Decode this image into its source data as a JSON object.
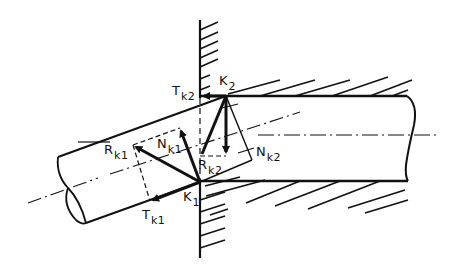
{
  "diagram": {
    "title": "",
    "stroke_color": "#111111",
    "background": "#ffffff",
    "points": {
      "K1": {
        "label": "K",
        "sub": "1"
      },
      "K2": {
        "label": "K",
        "sub": "2"
      }
    },
    "forces": {
      "R_k1": {
        "label": "R",
        "sub": "k1"
      },
      "N_k1": {
        "label": "N",
        "sub": "k1"
      },
      "T_k1": {
        "label": "T",
        "sub": "k1"
      },
      "R_k2": {
        "label": "R",
        "sub": "k2"
      },
      "N_k2": {
        "label": "N",
        "sub": "k2"
      },
      "T_k2": {
        "label": "T",
        "sub": "k2"
      }
    }
  }
}
